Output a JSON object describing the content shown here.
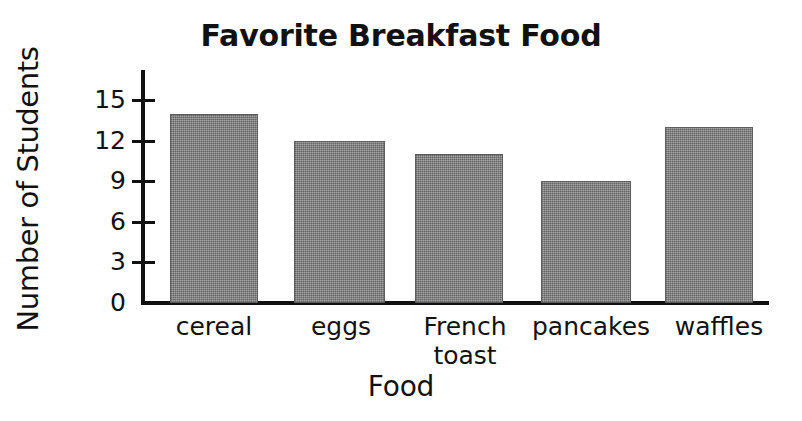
{
  "chart_data": {
    "type": "bar",
    "title": "Favorite Breakfast Food",
    "xlabel": "Food",
    "ylabel": "Number of Students",
    "categories": [
      "cereal",
      "eggs",
      "French toast",
      "pancakes",
      "waffles"
    ],
    "values": [
      14,
      12,
      11,
      9,
      13
    ],
    "ylim": [
      0,
      15
    ],
    "ytick_labels": [
      "0",
      "3",
      "6",
      "9",
      "12",
      "15"
    ],
    "ytick_values": [
      0,
      3,
      6,
      9,
      12,
      15
    ],
    "grid": false,
    "legend": false,
    "bar_color": "#8b8b8b",
    "axis_color": "#111111",
    "background_color": "#ffffff"
  },
  "bars": [
    {
      "label": "cereal",
      "label_line1": "cereal",
      "label_line2": "",
      "value": 14
    },
    {
      "label": "eggs",
      "label_line1": "eggs",
      "label_line2": "",
      "value": 12
    },
    {
      "label": "French toast",
      "label_line1": "French",
      "label_line2": "toast",
      "value": 11
    },
    {
      "label": "pancakes",
      "label_line1": "pancakes",
      "label_line2": "",
      "value": 9
    },
    {
      "label": "waffles",
      "label_line1": "waffles",
      "label_line2": "",
      "value": 13
    }
  ],
  "yticks": [
    {
      "label": "15",
      "value": 15
    },
    {
      "label": "12",
      "value": 12
    },
    {
      "label": "9",
      "value": 9
    },
    {
      "label": "6",
      "value": 6
    },
    {
      "label": "3",
      "value": 3
    },
    {
      "label": "0",
      "value": 0
    }
  ]
}
